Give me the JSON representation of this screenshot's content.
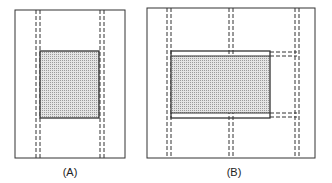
{
  "panels": [
    {
      "id": "A",
      "label": "(A)"
    },
    {
      "id": "B",
      "label": "(B)"
    }
  ],
  "colors": {
    "stroke": "#333333",
    "fill": "#cfcfcf"
  }
}
